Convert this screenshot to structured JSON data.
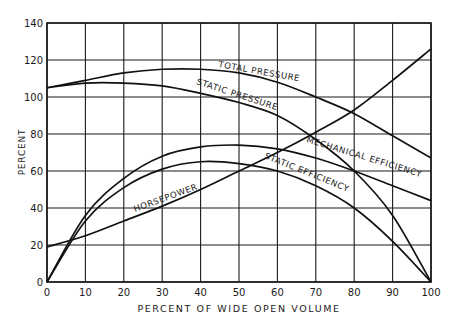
{
  "chart_data": {
    "type": "line",
    "title": "",
    "xlabel": "PERCENT OF WIDE OPEN VOLUME",
    "ylabel": "PERCENT",
    "xlim": [
      0,
      100
    ],
    "ylim": [
      0,
      140
    ],
    "x_ticks": [
      0,
      10,
      20,
      30,
      40,
      50,
      60,
      70,
      80,
      90,
      100
    ],
    "y_ticks": [
      0,
      20,
      40,
      60,
      80,
      100,
      120,
      140
    ],
    "grid": true,
    "legend": "none (curves labeled inline)",
    "x": [
      0,
      10,
      20,
      30,
      40,
      50,
      60,
      70,
      80,
      90,
      100
    ],
    "series": [
      {
        "name": "TOTAL PRESSURE",
        "values": [
          105,
          109,
          113,
          115,
          115,
          113,
          108,
          100,
          91,
          79,
          67
        ]
      },
      {
        "name": "STATIC PRESSURE",
        "values": [
          105,
          107.5,
          107.5,
          106,
          102,
          97,
          90,
          77,
          60,
          36,
          0
        ]
      },
      {
        "name": "MECHANICAL EFFICIENCY",
        "values": [
          0,
          36,
          56,
          68,
          73,
          74,
          72,
          67,
          60,
          52,
          44
        ]
      },
      {
        "name": "STATIC EFFICIENCY",
        "values": [
          0,
          33,
          51,
          61,
          65,
          64,
          60,
          52,
          40,
          22,
          0
        ]
      },
      {
        "name": "HORSEPOWER",
        "values": [
          19,
          25,
          33,
          41,
          50,
          60,
          70,
          81,
          93,
          109,
          126
        ]
      }
    ],
    "annotations": [
      {
        "text": "TOTAL PRESSURE",
        "near_x": 72,
        "near_y": 118
      },
      {
        "text": "STATIC PRESSURE",
        "near_x": 48,
        "near_y": 106
      },
      {
        "text": "MECHANICAL EFFICIENCY",
        "near_x": 80,
        "near_y": 68
      },
      {
        "text": "STATIC EFFICIENCY",
        "near_x": 64,
        "near_y": 63
      },
      {
        "text": "HORSEPOWER",
        "near_x": 22,
        "near_y": 43
      }
    ]
  }
}
